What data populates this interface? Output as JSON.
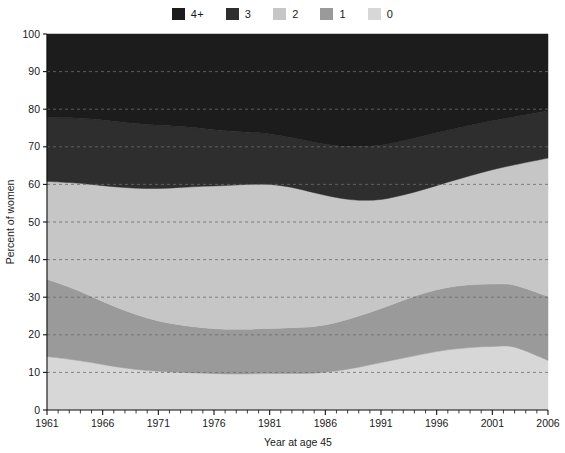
{
  "chart_data": {
    "type": "area",
    "stacked": true,
    "title": "",
    "xlabel": "Year at age 45",
    "ylabel": "Percent of women",
    "xlim": [
      1961,
      2006
    ],
    "ylim": [
      0,
      100
    ],
    "grid": "horizontal-dashed",
    "legend_position": "top-center",
    "x_tick_labels": [
      "1961",
      "1966",
      "1971",
      "1976",
      "1981",
      "1986",
      "1991",
      "1996",
      "2001",
      "2006"
    ],
    "x_tick_values": [
      1961,
      1966,
      1971,
      1976,
      1981,
      1986,
      1991,
      1996,
      2001,
      2006
    ],
    "x_minor_tick_step": 1,
    "y_tick_labels": [
      "0",
      "10",
      "20",
      "30",
      "40",
      "50",
      "60",
      "70",
      "80",
      "90",
      "100"
    ],
    "y_tick_values": [
      0,
      10,
      20,
      30,
      40,
      50,
      60,
      70,
      80,
      90,
      100
    ],
    "x": [
      1961,
      1963,
      1965,
      1967,
      1969,
      1971,
      1973,
      1975,
      1977,
      1979,
      1981,
      1983,
      1985,
      1987,
      1989,
      1991,
      1993,
      1995,
      1997,
      1999,
      2001,
      2003,
      2006
    ],
    "series": [
      {
        "name": "0",
        "label": "0",
        "color": "#d7d7d7",
        "stack_order": 1,
        "values": [
          14.2,
          13.5,
          12.6,
          11.6,
          10.8,
          10.3,
          10.0,
          9.8,
          9.6,
          9.6,
          9.7,
          9.7,
          9.8,
          10.4,
          11.4,
          12.6,
          13.8,
          15.0,
          16.0,
          16.6,
          16.9,
          16.7,
          13.2
        ]
      },
      {
        "name": "1",
        "label": "1",
        "color": "#9a9a9a",
        "stack_order": 2,
        "values": [
          20.6,
          19.2,
          17.6,
          16.0,
          14.6,
          13.4,
          12.6,
          12.1,
          11.9,
          11.9,
          12.0,
          12.2,
          12.4,
          12.9,
          13.6,
          14.4,
          15.4,
          16.2,
          16.6,
          16.7,
          16.6,
          16.5,
          17.0
        ]
      },
      {
        "name": "2",
        "label": "2",
        "color": "#c6c6c6",
        "stack_order": 3,
        "values": [
          26.0,
          27.8,
          29.8,
          31.8,
          33.6,
          35.2,
          36.6,
          37.6,
          38.2,
          38.5,
          38.3,
          37.3,
          35.6,
          33.2,
          30.8,
          29.0,
          28.0,
          27.6,
          28.0,
          29.0,
          30.4,
          32.0,
          36.8
        ]
      },
      {
        "name": "3",
        "label": "3",
        "color": "#2e2e2e",
        "stack_order": 4,
        "values": [
          17.0,
          17.2,
          17.4,
          17.4,
          17.2,
          16.8,
          16.2,
          15.4,
          14.6,
          13.9,
          13.4,
          13.2,
          13.4,
          13.8,
          14.2,
          14.4,
          14.4,
          14.2,
          13.8,
          13.4,
          13.0,
          12.8,
          12.6
        ]
      },
      {
        "name": "4+",
        "label": "4+",
        "color": "#1c1c1c",
        "stack_order": 5,
        "values": [
          22.2,
          22.3,
          22.6,
          23.2,
          23.8,
          24.3,
          24.6,
          25.1,
          25.7,
          26.1,
          26.6,
          27.6,
          28.8,
          29.7,
          30.0,
          29.6,
          28.4,
          27.0,
          25.6,
          24.3,
          23.1,
          22.0,
          20.4
        ]
      }
    ],
    "legend_entries": [
      {
        "label": "4+",
        "color": "#1c1c1c"
      },
      {
        "label": "3",
        "color": "#2e2e2e"
      },
      {
        "label": "2",
        "color": "#c6c6c6"
      },
      {
        "label": "1",
        "color": "#9a9a9a"
      },
      {
        "label": "0",
        "color": "#d7d7d7"
      }
    ]
  },
  "legend": {
    "items": [
      {
        "label": "4+"
      },
      {
        "label": "3"
      },
      {
        "label": "2"
      },
      {
        "label": "1"
      },
      {
        "label": "0"
      }
    ]
  },
  "axes": {
    "x_title": "Year at age 45",
    "y_title": "Percent of women"
  }
}
